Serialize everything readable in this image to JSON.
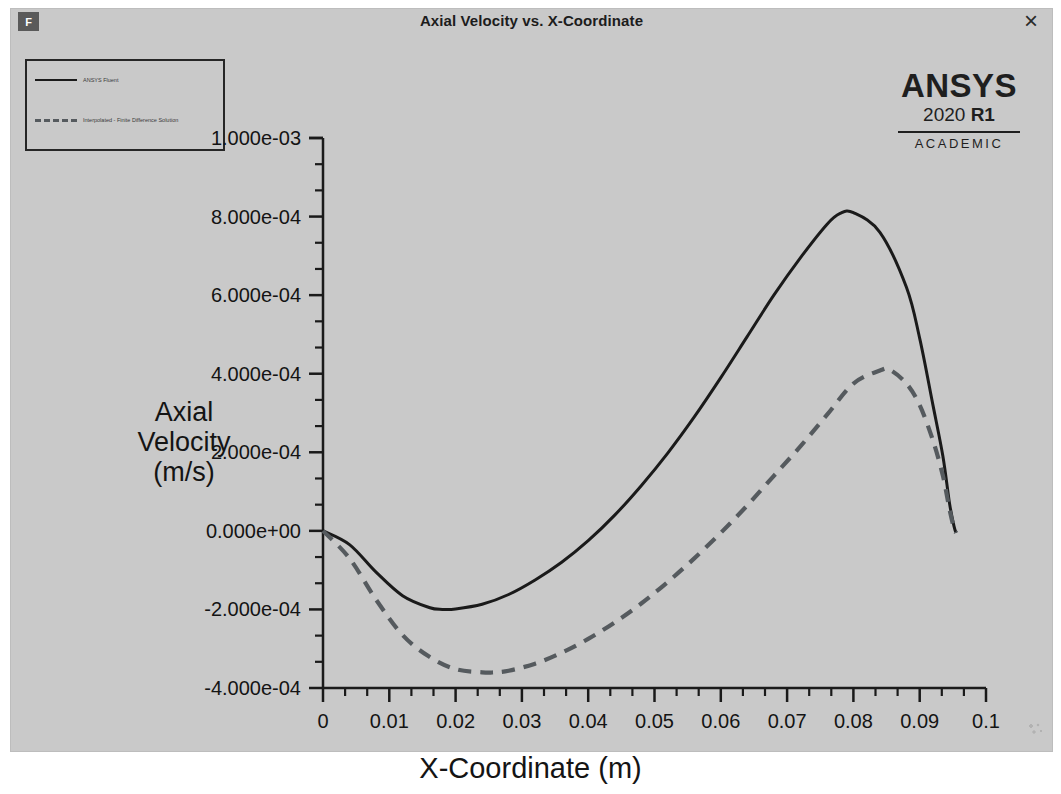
{
  "window": {
    "title": "Axial Velocity vs. X-Coordinate",
    "app_badge": "F",
    "close_label": "×"
  },
  "branding": {
    "name": "ANSYS",
    "year": "2020 ",
    "release": "R1",
    "edition": "ACADEMIC"
  },
  "legend": {
    "entries": [
      {
        "label": "ANSYS Fluent",
        "style": "solid"
      },
      {
        "label": "Interpolated - Finite Difference Solution",
        "style": "dashed"
      }
    ]
  },
  "chart_data": {
    "type": "line",
    "title": "Axial Velocity vs. X-Coordinate",
    "xlabel": "X-Coordinate (m)",
    "ylabel": "Axial Velocity (m/s)",
    "xlim": [
      0,
      0.1
    ],
    "ylim": [
      -0.0004,
      0.001
    ],
    "grid": false,
    "legend_position": "top-left",
    "xticks": [
      "0",
      "0.01",
      "0.02",
      "0.03",
      "0.04",
      "0.05",
      "0.06",
      "0.07",
      "0.08",
      "0.09",
      "0.1"
    ],
    "xtick_values": [
      0,
      0.01,
      0.02,
      0.03,
      0.04,
      0.05,
      0.06,
      0.07,
      0.08,
      0.09,
      0.1
    ],
    "yticks": [
      "1.000e-03",
      "8.000e-04",
      "6.000e-04",
      "4.000e-04",
      "2.000e-04",
      "0.000e+00",
      "-2.000e-04",
      "-4.000e-04"
    ],
    "ytick_values": [
      0.001,
      0.0008,
      0.0006,
      0.0004,
      0.0002,
      0,
      -0.0002,
      -0.0004
    ],
    "minor_ticks_per_interval": 2,
    "series": [
      {
        "name": "ANSYS Fluent",
        "style": "solid",
        "color": "#1a1a1a",
        "x": [
          0.0,
          0.004,
          0.008,
          0.012,
          0.016,
          0.018,
          0.02,
          0.024,
          0.028,
          0.032,
          0.036,
          0.04,
          0.044,
          0.048,
          0.052,
          0.056,
          0.06,
          0.064,
          0.068,
          0.072,
          0.076,
          0.078,
          0.08,
          0.084,
          0.088,
          0.09,
          0.092,
          0.0935,
          0.0945,
          0.0952,
          0.0955
        ],
        "y": [
          0.0,
          -3.5e-05,
          -0.000105,
          -0.000165,
          -0.000195,
          -0.0002,
          -0.000199,
          -0.000187,
          -0.000162,
          -0.000125,
          -8e-05,
          -2.5e-05,
          4e-05,
          0.000115,
          0.000198,
          0.00029,
          0.00039,
          0.000495,
          0.0006,
          0.000695,
          0.00078,
          0.000808,
          0.00081,
          0.00076,
          0.00062,
          0.00049,
          0.00032,
          0.00019,
          7e-05,
          1e-05,
          -5e-06
        ]
      },
      {
        "name": "Interpolated - Finite Difference Solution",
        "style": "dashed",
        "color": "#555a5e",
        "x": [
          0.0,
          0.004,
          0.008,
          0.012,
          0.016,
          0.02,
          0.024,
          0.0255,
          0.028,
          0.032,
          0.036,
          0.04,
          0.044,
          0.048,
          0.052,
          0.056,
          0.06,
          0.064,
          0.068,
          0.072,
          0.076,
          0.08,
          0.084,
          0.0855,
          0.088,
          0.09,
          0.092,
          0.0935,
          0.0945,
          0.0952,
          0.0955
        ],
        "y": [
          0.0,
          -7e-05,
          -0.000175,
          -0.000265,
          -0.00032,
          -0.000352,
          -0.00036,
          -0.0003605,
          -0.000356,
          -0.000338,
          -0.00031,
          -0.000275,
          -0.000233,
          -0.000185,
          -0.00013,
          -7e-05,
          -5e-06,
          6.5e-05,
          0.00014,
          0.000215,
          0.000295,
          0.000375,
          0.000408,
          0.00041,
          0.000375,
          0.00032,
          0.00023,
          0.00014,
          5.5e-05,
          5e-06,
          -5e-06
        ]
      }
    ]
  }
}
